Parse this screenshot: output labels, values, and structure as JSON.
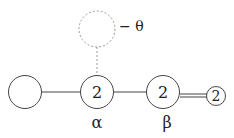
{
  "diagram": {
    "nodes": [
      {
        "id": "left",
        "label": "",
        "sublabel": ""
      },
      {
        "id": "alpha",
        "label": "2",
        "sublabel": "α"
      },
      {
        "id": "beta",
        "label": "2",
        "sublabel": "β"
      },
      {
        "id": "end",
        "label": "2",
        "sublabel": ""
      },
      {
        "id": "theta",
        "label": "",
        "sublabel": "− θ",
        "style": "dashed"
      }
    ],
    "edges": [
      {
        "from": "left",
        "to": "alpha",
        "type": "single"
      },
      {
        "from": "alpha",
        "to": "beta",
        "type": "single"
      },
      {
        "from": "beta",
        "to": "end",
        "type": "double"
      },
      {
        "from": "alpha",
        "to": "theta",
        "type": "dotted"
      }
    ],
    "colors": {
      "stroke": "#333333",
      "dashed": "#999999"
    }
  }
}
